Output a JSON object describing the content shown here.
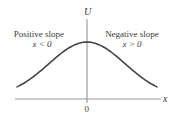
{
  "diagram": {
    "type": "potential-energy-curve",
    "y_axis_label": "U",
    "x_axis_label": "x",
    "origin_label": "0",
    "regions": [
      {
        "title": "Positive slope",
        "condition": "x < 0"
      },
      {
        "title": "Negative slope",
        "condition": "x > 0"
      }
    ],
    "curve": {
      "shape": "bell",
      "peak_at_x": 0,
      "color": "#444444"
    },
    "axis_color": "#999999"
  }
}
